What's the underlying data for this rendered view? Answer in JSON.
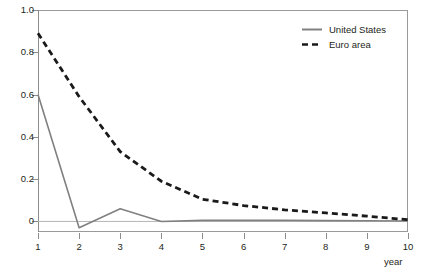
{
  "chart_data": {
    "type": "line",
    "title": "",
    "xlabel": "year",
    "ylabel": "",
    "x": [
      1,
      2,
      3,
      4,
      5,
      6,
      7,
      8,
      9,
      10
    ],
    "xlim": [
      1,
      10
    ],
    "ylim": [
      -0.05,
      1.0
    ],
    "grid": false,
    "legend_position": "top-right",
    "y_ticks": [
      "1.0",
      "0.8",
      "0.6",
      "0.4",
      "0.2",
      "0"
    ],
    "y_tick_values": [
      1.0,
      0.8,
      0.6,
      0.4,
      0.2,
      0
    ],
    "x_ticks": [
      "1",
      "2",
      "3",
      "4",
      "5",
      "6",
      "7",
      "8",
      "9",
      "10"
    ],
    "zero_line": 0,
    "series": [
      {
        "name": "United States",
        "style": "solid",
        "color": "#808080",
        "values": [
          0.6,
          -0.03,
          0.06,
          0.0,
          0.005,
          0.005,
          0.005,
          0.004,
          0.003,
          0.002
        ]
      },
      {
        "name": "Euro area",
        "style": "dashed",
        "color": "#1a1a1a",
        "values": [
          0.89,
          0.59,
          0.33,
          0.19,
          0.105,
          0.075,
          0.055,
          0.04,
          0.025,
          0.008
        ]
      }
    ]
  },
  "legend": {
    "items": [
      {
        "label": "United States",
        "swatch": "solid-line-swatch"
      },
      {
        "label": "Euro area",
        "swatch": "dashed-line-swatch"
      }
    ]
  },
  "axes": {
    "x_axis_title": "year"
  }
}
